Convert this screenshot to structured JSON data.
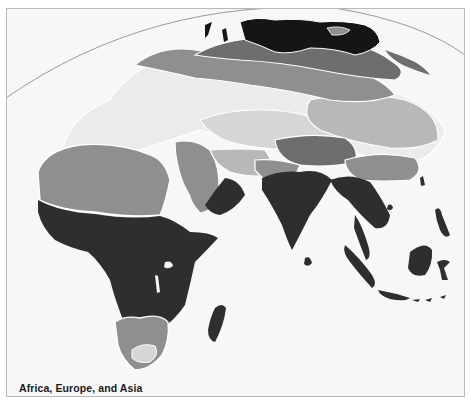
{
  "map": {
    "caption": "Africa, Europe, and Asia",
    "region": "Africa, Europe, and Asia",
    "style": "grayscale thematic zones",
    "legend": null,
    "colors": {
      "ocean": "#f7f7f7",
      "outside_globe": "#ffffff",
      "frame_border": "#b9b9b9",
      "graticule": "#9a9a9a",
      "zone_darkest": "#151515",
      "zone_dark": "#2e2e2e",
      "zone_mid_dark": "#6e6e6e",
      "zone_mid": "#8f8f8f",
      "zone_light": "#b8b8b8",
      "zone_lighter": "#d6d6d6",
      "zone_lightest": "#ebebeb",
      "zone_outline": "#ffffff"
    },
    "zones": [
      {
        "name": "arctic-siberia",
        "shade": "zone_darkest"
      },
      {
        "name": "northern-eurasia-band",
        "shade": "zone_mid_dark"
      },
      {
        "name": "central-eurasia-band",
        "shade": "zone_mid"
      },
      {
        "name": "central-asia-band",
        "shade": "zone_light"
      },
      {
        "name": "europe-mediterranean",
        "shade": "zone_lightest"
      },
      {
        "name": "sahara-arabia",
        "shade": "zone_mid"
      },
      {
        "name": "tibet-china",
        "shade": "zone_mid_dark"
      },
      {
        "name": "tropical-africa-south-asia",
        "shade": "zone_dark"
      },
      {
        "name": "southern-africa-highland",
        "shade": "zone_mid"
      },
      {
        "name": "southern-africa-core",
        "shade": "zone_lighter"
      }
    ]
  }
}
